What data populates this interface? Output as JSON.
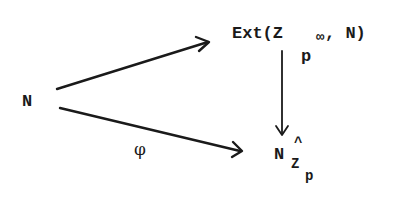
{
  "diagram": {
    "type": "commutative-diagram",
    "nodes": {
      "source": {
        "label": "N"
      },
      "ext": {
        "prefix": "Ext(Z",
        "subscript_base": "p",
        "subscript_exp": "∞",
        "suffix": ", N)"
      },
      "completion": {
        "base": "N",
        "hat": "^",
        "subscript": "Z",
        "subsubscript": "p"
      }
    },
    "arrows": [
      {
        "from": "N",
        "to": "Ext(Z_{p^∞}, N)",
        "label": ""
      },
      {
        "from": "Ext(Z_{p^∞}, N)",
        "to": "N̂_{Z_p}",
        "label": ""
      },
      {
        "from": "N",
        "to": "N̂_{Z_p}",
        "label": "φ"
      }
    ],
    "arrow_labels": {
      "phi": "φ"
    }
  }
}
